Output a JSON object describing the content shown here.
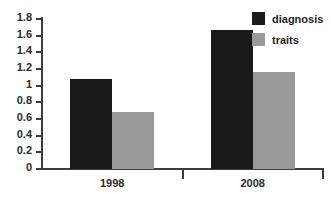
{
  "chart_data": {
    "type": "bar",
    "title": "",
    "xlabel": "",
    "ylabel": "",
    "categories": [
      "1998",
      "2008"
    ],
    "series": [
      {
        "name": "diagnosis",
        "color": "#1a1a1a",
        "values": [
          1.08,
          1.67
        ]
      },
      {
        "name": "traits",
        "color": "#999999",
        "values": [
          0.68,
          1.16
        ]
      }
    ],
    "ylim": [
      0,
      1.8
    ],
    "ytick_step": 0.2,
    "ytick_labels": [
      "0",
      "0.2",
      "0.4",
      "0.6",
      "0.8",
      "1",
      "1.2",
      "1.4",
      "1.6",
      "1.8"
    ],
    "ytick_values": [
      0,
      0.2,
      0.4,
      0.6,
      0.8,
      1,
      1.2,
      1.4,
      1.6,
      1.8
    ],
    "grid": false,
    "legend_position": "top-right"
  },
  "legend": {
    "entries": [
      {
        "label": "diagnosis"
      },
      {
        "label": "traits"
      }
    ]
  },
  "axis": {
    "categories": [
      {
        "label": "1998"
      },
      {
        "label": "2008"
      }
    ]
  },
  "colors": {
    "diagnosis": "#1a1a1a",
    "traits": "#999999",
    "axis": "#3c3c3c",
    "text": "#2b2b2b",
    "background": "#ffffff"
  }
}
